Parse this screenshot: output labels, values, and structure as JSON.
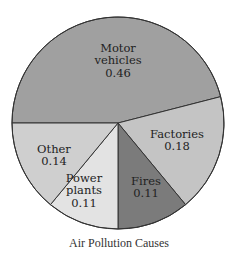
{
  "chart_data": {
    "type": "pie",
    "title": "Air Pollution Causes",
    "categories": [
      "Motor vehicles",
      "Factories",
      "Fires",
      "Power plants",
      "Other"
    ],
    "values": [
      0.46,
      0.18,
      0.11,
      0.11,
      0.14
    ],
    "value_labels": [
      "0.46",
      "0.18",
      "0.11",
      "0.11",
      "0.14"
    ],
    "label_lines": [
      [
        "Motor",
        "vehicles"
      ],
      [
        "Factories"
      ],
      [
        "Fires"
      ],
      [
        "Power",
        "plants"
      ],
      [
        "Other"
      ]
    ],
    "colors": [
      "#a0a0a0",
      "#c4c4c4",
      "#7b7b7b",
      "#e3e3e3",
      "#cfcfcf"
    ],
    "start_angle_deg": 270,
    "direction": "clockwise",
    "legend": "none (labels inside slices)"
  },
  "caption": "Air Pollution Causes"
}
